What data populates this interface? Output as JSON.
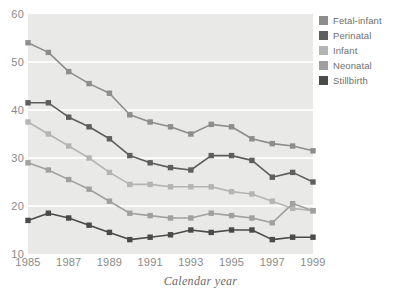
{
  "chart_data": {
    "type": "line",
    "title": "",
    "subtitle": "",
    "xlabel": "Calendar year",
    "ylabel": "",
    "xlim": [
      1985,
      1999
    ],
    "ylim": [
      10,
      60
    ],
    "grid": "horizontal",
    "legend_position": "top-right",
    "x": [
      1985,
      1986,
      1987,
      1988,
      1989,
      1990,
      1991,
      1992,
      1993,
      1994,
      1995,
      1996,
      1997,
      1998,
      1999
    ],
    "x_tick_labels": [
      "1985",
      "1987",
      "1989",
      "1991",
      "1993",
      "1995",
      "1997",
      "1999"
    ],
    "x_tick_values": [
      1985,
      1987,
      1989,
      1991,
      1993,
      1995,
      1997,
      1999
    ],
    "y_tick_labels": [
      "10",
      "20",
      "30",
      "40",
      "50",
      "60"
    ],
    "y_tick_values": [
      10,
      20,
      30,
      40,
      50,
      60
    ],
    "series": [
      {
        "name": "Fetal-infant",
        "color": "#8d8d8b",
        "values": [
          54.0,
          52.0,
          48.0,
          45.5,
          43.5,
          39.0,
          37.5,
          36.5,
          35.0,
          37.0,
          36.5,
          34.0,
          33.0,
          32.5,
          31.5
        ]
      },
      {
        "name": "Perinatal",
        "color": "#5e5e5c",
        "values": [
          41.5,
          41.5,
          38.5,
          36.5,
          34.0,
          30.5,
          29.0,
          28.0,
          27.5,
          30.5,
          30.5,
          29.5,
          26.0,
          27.0,
          25.0
        ]
      },
      {
        "name": "Infant",
        "color": "#b4b4b2",
        "values": [
          37.5,
          35.0,
          32.5,
          30.0,
          27.0,
          24.5,
          24.5,
          24.0,
          24.0,
          24.0,
          23.0,
          22.5,
          21.0,
          19.5,
          19.0
        ]
      },
      {
        "name": "Neonatal",
        "color": "#a0a09e",
        "values": [
          29.0,
          27.5,
          25.5,
          23.5,
          21.0,
          18.5,
          18.0,
          17.5,
          17.5,
          18.5,
          18.0,
          17.5,
          16.5,
          20.5,
          19.0
        ]
      },
      {
        "name": "Stillbirth",
        "color": "#4a4a48",
        "values": [
          17.0,
          18.5,
          17.5,
          16.0,
          14.5,
          13.0,
          13.5,
          14.0,
          15.0,
          14.5,
          15.0,
          15.0,
          13.0,
          13.5,
          13.5
        ]
      }
    ],
    "plot_background": "#e9e9e7",
    "gridline_color": "#fbfbfa"
  },
  "axis": {
    "x_title": "Calendar year"
  },
  "legend": {
    "items": [
      {
        "label": "Fetal-infant",
        "color": "#8d8d8b"
      },
      {
        "label": "Perinatal",
        "color": "#5e5e5c"
      },
      {
        "label": "Infant",
        "color": "#b4b4b2"
      },
      {
        "label": "Neonatal",
        "color": "#a0a09e"
      },
      {
        "label": "Stillbirth",
        "color": "#4a4a48"
      }
    ]
  }
}
